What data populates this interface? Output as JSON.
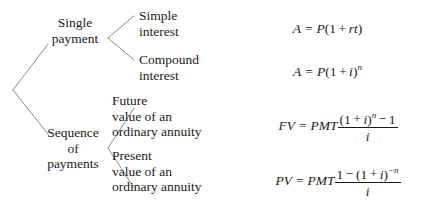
{
  "diagram": {
    "root": {
      "label": ""
    },
    "branches": [
      {
        "label_lines": [
          "Single",
          "payment"
        ],
        "children": [
          {
            "label_lines": [
              "Simple",
              "interest"
            ],
            "formula": {
              "lhs": "A",
              "eq": "=",
              "rhs_parts": [
                "P",
                "(1",
                "+",
                "rt",
                ")"
              ],
              "plain": "A = P(1 + rt)"
            }
          },
          {
            "label_lines": [
              "Compound",
              "interest"
            ],
            "formula": {
              "lhs": "A",
              "eq": "=",
              "rhs_parts": [
                "P",
                "(1",
                "+",
                "i",
                ")",
                "n"
              ],
              "plain": "A = P(1 + i)^n"
            }
          }
        ]
      },
      {
        "label_lines": [
          "Sequence",
          "of",
          "payments"
        ],
        "children": [
          {
            "label_lines": [
              "Future",
              "value of an",
              "ordinary annuity"
            ],
            "formula": {
              "lhs": "FV",
              "eq": "=",
              "coef": "PMT",
              "numerator": "(1 + i)^n − 1",
              "denominator": "i",
              "plain": "FV = PMT[(1 + i)^n − 1] / i"
            }
          },
          {
            "label_lines": [
              "Present",
              "value of an",
              "ordinary annuity"
            ],
            "formula": {
              "lhs": "PV",
              "eq": "=",
              "coef": "PMT",
              "numerator": "1 − (1 + i)^−n",
              "denominator": "i",
              "plain": "PV = PMT[1 − (1 + i)^−n] / i"
            }
          }
        ]
      }
    ],
    "symbols": {
      "A": "A",
      "P": "P",
      "r": "r",
      "t": "t",
      "i": "i",
      "n": "n",
      "minus_n": "−n",
      "one": "1",
      "open_paren": "(",
      "close_paren": ")",
      "plus": "+",
      "minus": "−",
      "equals": "=",
      "one_paren": "(1",
      "FV": "FV",
      "PV": "PV",
      "PMT": "PMT"
    },
    "colors": {
      "line": "#8a8a8a",
      "text": "#1a1a1a",
      "background": "#ffffff"
    }
  }
}
